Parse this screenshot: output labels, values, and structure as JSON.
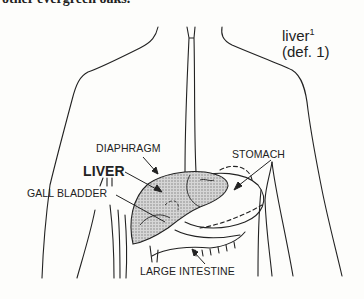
{
  "top_text": "other evergreen oaks.",
  "headword": {
    "word": "liver",
    "superscript": "1",
    "definition_ref": "(def. 1)"
  },
  "labels": {
    "diaphragm": "DIAPHRAGM",
    "stomach": "STOMACH",
    "liver": "LIVER",
    "gall_bladder": "GALL BLADDER",
    "large_intestine": "LARGE INTESTINE"
  },
  "colors": {
    "ink": "#222222",
    "liver_fill": "#bdbdbd",
    "background": "#fdfdfb"
  }
}
